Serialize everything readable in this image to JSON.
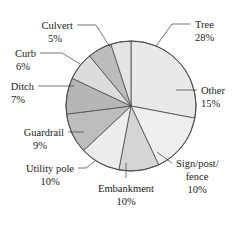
{
  "chart_data": {
    "type": "pie",
    "title": "",
    "subtitle": "",
    "xlabel": "",
    "ylabel": "",
    "legend_position": "none",
    "grid": false,
    "unit": "%",
    "total": 100,
    "categories": [
      "Tree",
      "Other",
      "Sign/post/fence",
      "Embankment",
      "Utility pole",
      "Guardrail",
      "Ditch",
      "Curb",
      "Culvert"
    ],
    "values": [
      28,
      15,
      10,
      10,
      10,
      9,
      7,
      6,
      5
    ],
    "slices": [
      {
        "label": "Tree",
        "value": 28,
        "value_text": "28%",
        "color": "#e9e9e9",
        "label_lines": [
          "Tree",
          "28%"
        ]
      },
      {
        "label": "Other",
        "value": 15,
        "value_text": "15%",
        "color": "#efefef",
        "label_lines": [
          "Other",
          "15%"
        ]
      },
      {
        "label": "Sign/post/fence",
        "value": 10,
        "value_text": "10%",
        "color": "#d5d5d5",
        "label_lines": [
          "Sign/post/",
          "fence",
          "10%"
        ]
      },
      {
        "label": "Embankment",
        "value": 10,
        "value_text": "10%",
        "color": "#ededed",
        "label_lines": [
          "Embankment",
          "10%"
        ]
      },
      {
        "label": "Utility pole",
        "value": 10,
        "value_text": "10%",
        "color": "#bdbdbd",
        "label_lines": [
          "Utility pole",
          "10%"
        ]
      },
      {
        "label": "Guardrail",
        "value": 9,
        "value_text": "9%",
        "color": "#b6b6b6",
        "label_lines": [
          "Guardrail",
          "9%"
        ]
      },
      {
        "label": "Ditch",
        "value": 7,
        "value_text": "7%",
        "color": "#dcdcdc",
        "label_lines": [
          "Ditch",
          "7%"
        ]
      },
      {
        "label": "Curb",
        "value": 6,
        "value_text": "6%",
        "color": "#bcbcbc",
        "label_lines": [
          "Curb",
          "6%"
        ]
      },
      {
        "label": "Culvert",
        "value": 5,
        "value_text": "5%",
        "color": "#e4e4e4",
        "label_lines": [
          "Culvert",
          "5%"
        ]
      }
    ]
  },
  "labels": {
    "tree": {
      "name": "Tree",
      "pct": "28%"
    },
    "other": {
      "name": "Other",
      "pct": "15%"
    },
    "sign_l1": {
      "name": "Sign/post/"
    },
    "sign_l2": {
      "name": "fence",
      "pct": "10%"
    },
    "embankment": {
      "name": "Embankment",
      "pct": "10%"
    },
    "utility": {
      "name": "Utility pole",
      "pct": "10%"
    },
    "guardrail": {
      "name": "Guardrail",
      "pct": "9%"
    },
    "ditch": {
      "name": "Ditch",
      "pct": "7%"
    },
    "curb": {
      "name": "Curb",
      "pct": "6%"
    },
    "culvert": {
      "name": "Culvert",
      "pct": "5%"
    }
  },
  "style": {
    "outline_color": "#4a4a4a",
    "leader_color": "#3a3a3a",
    "background": "#ffffff",
    "text_color": "#1a1a1a"
  }
}
